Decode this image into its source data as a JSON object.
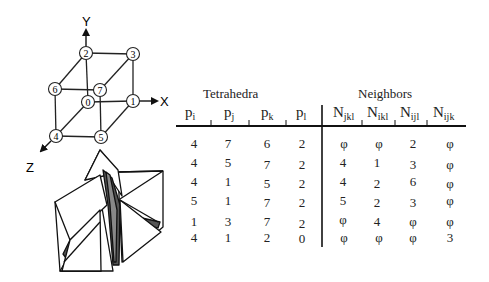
{
  "figure": {
    "cube": {
      "axes": {
        "x": "X",
        "y": "Y",
        "z": "Z"
      },
      "nodes": [
        {
          "id": "0",
          "x": 88,
          "y": 102
        },
        {
          "id": "1",
          "x": 133,
          "y": 101
        },
        {
          "id": "2",
          "x": 86,
          "y": 53
        },
        {
          "id": "3",
          "x": 133,
          "y": 54
        },
        {
          "id": "4",
          "x": 56,
          "y": 136
        },
        {
          "id": "5",
          "x": 101,
          "y": 137
        },
        {
          "id": "6",
          "x": 55,
          "y": 89
        },
        {
          "id": "7",
          "x": 100,
          "y": 90
        }
      ]
    },
    "table": {
      "tetrahedra_title": "Tetrahedra",
      "neighbors_title": "Neighbors",
      "tetra_headers": [
        {
          "base": "p",
          "sub": "i"
        },
        {
          "base": "p",
          "sub": "j"
        },
        {
          "base": "p",
          "sub": "k"
        },
        {
          "base": "p",
          "sub": "l"
        }
      ],
      "neighbor_headers": [
        {
          "base": "N",
          "sub": "jkl"
        },
        {
          "base": "N",
          "sub": "ikl"
        },
        {
          "base": "N",
          "sub": "ijl"
        },
        {
          "base": "N",
          "sub": "ijk"
        }
      ],
      "rows": [
        {
          "tetra": [
            "4",
            "7",
            "6",
            "2"
          ],
          "neighbors": [
            "φ",
            "φ",
            "2",
            "φ"
          ]
        },
        {
          "tetra": [
            "4",
            "5",
            "7",
            "2"
          ],
          "neighbors": [
            "4",
            "1",
            "3",
            "φ"
          ]
        },
        {
          "tetra": [
            "4",
            "1",
            "5",
            "2"
          ],
          "neighbors": [
            "4",
            "2",
            "6",
            "φ"
          ]
        },
        {
          "tetra": [
            "5",
            "1",
            "7",
            "2"
          ],
          "neighbors": [
            "5",
            "2",
            "3",
            "φ"
          ]
        },
        {
          "tetra": [
            "1",
            "3",
            "7",
            "2"
          ],
          "neighbors": [
            "φ",
            "4",
            "φ",
            "φ"
          ]
        },
        {
          "tetra": [
            "4",
            "1",
            "2",
            "0"
          ],
          "neighbors": [
            "φ",
            "φ",
            "φ",
            "3"
          ]
        }
      ]
    }
  }
}
